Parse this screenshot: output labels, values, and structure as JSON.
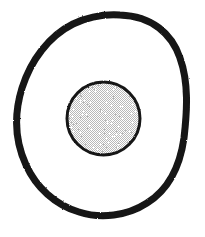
{
  "figure": {
    "title": "Ovoid outline enclosing a stippled circle",
    "caption": "",
    "background_color": "#ffffff",
    "canvas": {
      "width": 205,
      "height": 237
    },
    "style": "scanned black-and-white line drawing",
    "shapes": [
      {
        "name": "outer-ovoid-outline",
        "kind": "closed-curve",
        "stroke_color": "#141414",
        "fill_color": "none",
        "stroke_width": 7,
        "bounds": {
          "x": 14,
          "y": 13,
          "width": 177,
          "height": 205
        },
        "extremes": {
          "top": {
            "x": 120,
            "y": 15
          },
          "bottom": {
            "x": 107,
            "y": 214
          },
          "left": {
            "x": 17,
            "y": 139
          },
          "right": {
            "x": 186,
            "y": 101
          }
        },
        "path": "M120 15 C 152 16 172 34 180 58 C 189 83 187 112 184 138 C 180 166 168 190 147 203 C 127 216 101 219 79 212 C 55 205 36 187 26 165 C 15 141 14 114 22 88 C 31 60 49 36 73 24 C 88 17 104 14 120 15 Z"
      },
      {
        "name": "inner-stippled-circle",
        "kind": "circle",
        "stroke_color": "#161616",
        "fill_color": "#e3e3e3",
        "fill_pattern": "fine-checker-halftone",
        "pattern_colors": [
          "#ffffff",
          "#b9b9b9"
        ],
        "stroke_width": 3,
        "center": {
          "x": 103.5,
          "y": 118.5
        },
        "radius": 38
      }
    ],
    "colors": {
      "ink": "#141414",
      "paper": "#ffffff",
      "halftone_light": "#ffffff",
      "halftone_dark": "#b9b9b9",
      "halftone_mean": "#e3e3e3"
    }
  }
}
